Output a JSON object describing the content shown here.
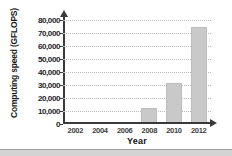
{
  "chart_data": {
    "type": "bar",
    "title": "",
    "xlabel": "Year",
    "ylabel": "Computing speed (GFLOPS)",
    "categories": [
      "2002",
      "2004",
      "2006",
      "2008",
      "2010",
      "2012"
    ],
    "values": [
      35,
      700,
      1200,
      12500,
      31500,
      74500
    ],
    "ylim": [
      0,
      80000
    ],
    "ytick_labels": [
      "0",
      "10,000",
      "20,000",
      "30,000",
      "40,000",
      "50,000",
      "60,000",
      "70,000",
      "80,000"
    ],
    "ytick_values": [
      0,
      10000,
      20000,
      30000,
      40000,
      50000,
      60000,
      70000,
      80000
    ],
    "grid": true,
    "grid_style": "dotted-horizontal",
    "legend": false,
    "bar_color": "#c9c9c9",
    "axis_color": "#3a3a3a",
    "gridline_color": "#b9b9b9",
    "background": "#ffffff"
  }
}
